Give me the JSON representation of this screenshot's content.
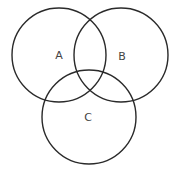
{
  "diagram": {
    "type": "venn",
    "stroke_color": "#2a2a2a",
    "label_color": "#444444",
    "sets": [
      {
        "id": "A",
        "label": "A",
        "cx": 59,
        "cy": 55,
        "r": 47,
        "label_x": 59,
        "label_y": 59
      },
      {
        "id": "B",
        "label": "B",
        "cx": 121,
        "cy": 55,
        "r": 47,
        "label_x": 122,
        "label_y": 60
      },
      {
        "id": "C",
        "label": "C",
        "cx": 89,
        "cy": 117,
        "r": 47,
        "label_x": 88,
        "label_y": 121
      }
    ]
  }
}
